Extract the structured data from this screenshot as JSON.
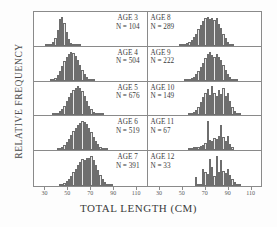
{
  "axes": {
    "ylabel": "RELATIVE FREQUENCY",
    "xlabel": "TOTAL  LENGTH  (CM)",
    "xticks": [
      "30",
      "50",
      "70",
      "90",
      "110"
    ],
    "xlim": [
      20,
      120
    ]
  },
  "panels": {
    "age3": {
      "age": "AGE 3",
      "n": "N =  104"
    },
    "age4": {
      "age": "AGE 4",
      "n": "N =  504"
    },
    "age5": {
      "age": "AGE 5",
      "n": "N =  676"
    },
    "age6": {
      "age": "AGE 6",
      "n": "N =  519"
    },
    "age7": {
      "age": "AGE 7",
      "n": "N =  391"
    },
    "age8": {
      "age": "AGE 8",
      "n": "N =  289"
    },
    "age9": {
      "age": "AGE 9",
      "n": "N =  222"
    },
    "age10": {
      "age": "AGE 10",
      "n": "N =  149"
    },
    "age11": {
      "age": "AGE 11",
      "n": "N =  67"
    },
    "age12": {
      "age": "AGE 12",
      "n": "N =  33"
    }
  },
  "chart_data": {
    "type": "bar",
    "title": "",
    "xlabel": "TOTAL LENGTH (CM)",
    "ylabel": "RELATIVE FREQUENCY",
    "xlim": [
      20,
      120
    ],
    "bin_width": 2,
    "grid": false,
    "legend": "none",
    "layout": "5 rows x 2 columns of stacked histogram panels; left column ages 3-7, right column ages 8-12",
    "panels": [
      {
        "name": "AGE 3",
        "n": 104,
        "position": "row1-left",
        "bins": [
          30,
          32,
          34,
          36,
          38,
          40,
          42,
          44,
          46,
          48,
          50,
          52,
          54,
          56,
          58,
          60
        ],
        "values": [
          0.01,
          0.02,
          0.05,
          0.12,
          0.28,
          0.55,
          0.92,
          1.0,
          0.8,
          0.46,
          0.22,
          0.09,
          0.04,
          0.02,
          0.01,
          0.01
        ]
      },
      {
        "name": "AGE 8",
        "n": 289,
        "position": "row1-right",
        "bins": [
          48,
          50,
          52,
          54,
          56,
          58,
          60,
          62,
          64,
          66,
          68,
          70,
          72,
          74,
          76,
          78,
          80,
          82,
          84,
          86,
          88,
          90,
          92,
          94
        ],
        "values": [
          0.02,
          0.04,
          0.06,
          0.1,
          0.14,
          0.2,
          0.3,
          0.42,
          0.58,
          0.72,
          0.86,
          0.95,
          1.0,
          0.92,
          0.97,
          0.88,
          0.95,
          0.74,
          0.6,
          0.42,
          0.26,
          0.14,
          0.07,
          0.03
        ]
      },
      {
        "name": "AGE 4",
        "n": 504,
        "position": "row2-left",
        "bins": [
          34,
          36,
          38,
          40,
          42,
          44,
          46,
          48,
          50,
          52,
          54,
          56,
          58,
          60,
          62,
          64,
          66,
          68,
          70,
          72
        ],
        "values": [
          0.02,
          0.05,
          0.1,
          0.2,
          0.34,
          0.5,
          0.66,
          0.8,
          0.92,
          1.0,
          0.96,
          0.86,
          0.7,
          0.52,
          0.36,
          0.22,
          0.12,
          0.06,
          0.03,
          0.01
        ]
      },
      {
        "name": "AGE 9",
        "n": 222,
        "position": "row2-right",
        "bins": [
          52,
          54,
          56,
          58,
          60,
          62,
          64,
          66,
          68,
          70,
          72,
          74,
          76,
          78,
          80,
          82,
          84,
          86,
          88,
          90,
          92,
          94,
          96,
          98
        ],
        "values": [
          0.02,
          0.03,
          0.05,
          0.08,
          0.14,
          0.22,
          0.34,
          0.48,
          0.62,
          0.78,
          0.9,
          1.0,
          0.88,
          0.8,
          0.9,
          0.82,
          0.7,
          0.54,
          0.38,
          0.24,
          0.13,
          0.07,
          0.04,
          0.02
        ]
      },
      {
        "name": "AGE 5",
        "n": 676,
        "position": "row3-left",
        "bins": [
          36,
          38,
          40,
          42,
          44,
          46,
          48,
          50,
          52,
          54,
          56,
          58,
          60,
          62,
          64,
          66,
          68,
          70,
          72,
          74,
          76,
          78,
          80
        ],
        "values": [
          0.02,
          0.04,
          0.08,
          0.14,
          0.22,
          0.34,
          0.48,
          0.62,
          0.76,
          0.88,
          0.96,
          1.0,
          0.95,
          0.84,
          0.68,
          0.5,
          0.34,
          0.21,
          0.12,
          0.07,
          0.04,
          0.02,
          0.01
        ]
      },
      {
        "name": "AGE 10",
        "n": 149,
        "position": "row3-right",
        "bins": [
          56,
          58,
          60,
          62,
          64,
          66,
          68,
          70,
          72,
          74,
          76,
          78,
          80,
          82,
          84,
          86,
          88,
          90,
          92,
          94,
          96,
          98,
          100
        ],
        "values": [
          0.03,
          0.06,
          0.1,
          0.18,
          0.3,
          0.46,
          0.62,
          0.78,
          0.9,
          0.7,
          1.0,
          0.78,
          0.66,
          0.86,
          0.72,
          0.94,
          0.66,
          0.78,
          0.5,
          0.3,
          0.16,
          0.08,
          0.04
        ]
      },
      {
        "name": "AGE 6",
        "n": 519,
        "position": "row4-left",
        "bins": [
          40,
          42,
          44,
          46,
          48,
          50,
          52,
          54,
          56,
          58,
          60,
          62,
          64,
          66,
          68,
          70,
          72,
          74,
          76,
          78,
          80,
          82,
          84
        ],
        "values": [
          0.02,
          0.05,
          0.1,
          0.18,
          0.28,
          0.4,
          0.54,
          0.66,
          0.78,
          0.88,
          0.94,
          1.0,
          0.96,
          0.9,
          0.78,
          0.62,
          0.46,
          0.32,
          0.2,
          0.12,
          0.06,
          0.03,
          0.01
        ]
      },
      {
        "name": "AGE 11",
        "n": 67,
        "position": "row4-right",
        "bins": [
          56,
          58,
          60,
          62,
          64,
          66,
          68,
          70,
          72,
          74,
          76,
          78,
          80,
          82,
          84,
          86,
          88,
          90,
          92,
          94
        ],
        "values": [
          0.08,
          0.06,
          0.1,
          0.12,
          0.1,
          0.14,
          0.18,
          0.26,
          1.0,
          0.34,
          0.3,
          0.42,
          0.38,
          0.5,
          0.88,
          0.46,
          0.3,
          0.48,
          0.22,
          0.1
        ]
      },
      {
        "name": "AGE 7",
        "n": 391,
        "position": "row5-left",
        "bins": [
          42,
          44,
          46,
          48,
          50,
          52,
          54,
          56,
          58,
          60,
          62,
          64,
          66,
          68,
          70,
          72,
          74,
          76,
          78,
          80,
          82,
          84,
          86,
          88
        ],
        "values": [
          0.02,
          0.05,
          0.09,
          0.16,
          0.24,
          0.34,
          0.46,
          0.58,
          0.7,
          0.8,
          0.9,
          0.86,
          0.94,
          0.92,
          1.0,
          0.88,
          0.7,
          0.52,
          0.36,
          0.22,
          0.13,
          0.07,
          0.03,
          0.01
        ]
      },
      {
        "name": "AGE 12",
        "n": 33,
        "position": "row5-right",
        "bins": [
          62,
          64,
          66,
          68,
          70,
          72,
          74,
          76,
          78,
          80,
          82,
          84,
          86,
          88,
          90,
          92,
          94,
          96,
          98,
          100
        ],
        "values": [
          0.3,
          0.04,
          0.06,
          0.56,
          0.46,
          0.4,
          0.9,
          0.62,
          0.34,
          1.0,
          0.46,
          0.86,
          0.5,
          0.42,
          0.56,
          0.36,
          0.24,
          0.14,
          0.08,
          0.04
        ]
      }
    ]
  }
}
